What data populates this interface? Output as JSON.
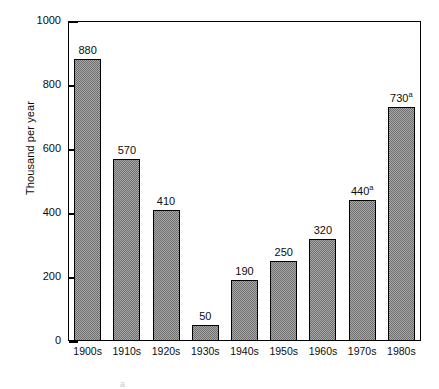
{
  "chart_data": {
    "type": "bar",
    "title": "",
    "xlabel": "",
    "ylabel": "Thousand per year",
    "ylim": [
      0,
      1000
    ],
    "yticks": [
      0,
      200,
      400,
      600,
      800,
      1000
    ],
    "ytick_labels": [
      "0",
      "200",
      "400",
      "600",
      "800",
      "1000"
    ],
    "grid": false,
    "legend": false,
    "categories": [
      "1900s",
      "1910s",
      "1920s",
      "1930s",
      "1940s",
      "1950s",
      "1960s",
      "1970s",
      "1980s"
    ],
    "values": [
      880,
      570,
      410,
      50,
      190,
      250,
      320,
      440,
      730
    ],
    "data_labels": [
      "880",
      "570",
      "410",
      "50",
      "190",
      "250",
      "320",
      "440",
      "730"
    ],
    "data_label_footnotes": [
      "",
      "",
      "",
      "",
      "",
      "",
      "",
      "a",
      "a"
    ],
    "bar_fill_color": "#a8a8a8",
    "bar_edge_color": "#000000",
    "frame_color": "#000000",
    "background_color": "#ffffff"
  },
  "footnote": {
    "marker": "a",
    "text": ""
  }
}
